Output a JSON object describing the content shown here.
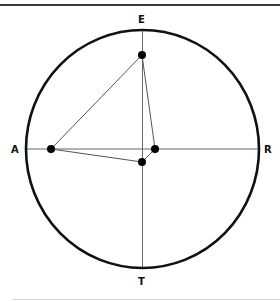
{
  "diagram": {
    "type": "circular-plot",
    "labels": {
      "top": "E",
      "left": "A",
      "right": "R",
      "bottom": "T"
    },
    "circle": {
      "cx": 142.5,
      "cy": 149,
      "rx": 116.5,
      "ry": 119,
      "stroke": "#111111"
    },
    "points": [
      {
        "name": "top-point",
        "x": 142,
        "y": 55
      },
      {
        "name": "left-point",
        "x": 51,
        "y": 149
      },
      {
        "name": "right-point",
        "x": 155,
        "y": 149
      },
      {
        "name": "bottom-point",
        "x": 142,
        "y": 162
      }
    ],
    "polygon_order": [
      "top-point",
      "left-point",
      "bottom-point",
      "right-point"
    ],
    "colors": {
      "axis": "#555555",
      "polygon": "#444444",
      "point": "#000000"
    }
  }
}
